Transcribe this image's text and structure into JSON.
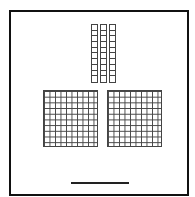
{
  "diagram": {
    "type": "base-ten-blocks",
    "hundreds_flats": 2,
    "tens_rods": 3,
    "ones_units": 0,
    "flat_grid": {
      "rows": 10,
      "cols": 10
    },
    "rod_cells": 10,
    "answer_line": ""
  }
}
